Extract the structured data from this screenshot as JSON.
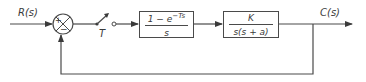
{
  "diagram": {
    "type": "control-block-diagram",
    "input": {
      "label": "R(s)"
    },
    "summing_junction": {
      "plus_sign": "+",
      "minus_sign": "−"
    },
    "sampler": {
      "label": "T"
    },
    "blocks": [
      {
        "id": "zoh",
        "numerator": "1 − e",
        "exponent": "−Ts",
        "denominator": "s"
      },
      {
        "id": "plant",
        "numerator": "K",
        "denominator": "s(s + a)"
      }
    ],
    "output": {
      "label": "C(s)"
    },
    "feedback": {
      "type": "unity negative feedback"
    },
    "colors": {
      "line": "#4a4a4a",
      "text": "#3a3a3a",
      "background": "#ffffff"
    }
  }
}
